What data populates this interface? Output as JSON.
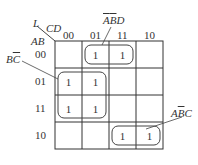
{
  "corner": {
    "l": "L",
    "cd": "CD",
    "ab": "AB"
  },
  "col_headers": [
    "00",
    "01",
    "11",
    "10"
  ],
  "row_headers": [
    "00",
    "01",
    "11",
    "10"
  ],
  "cells": [
    [
      "",
      "1",
      "1",
      ""
    ],
    [
      "1",
      "1",
      "",
      ""
    ],
    [
      "1",
      "1",
      "",
      ""
    ],
    [
      "",
      "",
      "1",
      "1"
    ]
  ],
  "groups": [
    {
      "label_plain": "A",
      "label_bar": "B",
      "label_tail": "D",
      "label_bar2": "A",
      "name": "ĀB̄D"
    },
    {
      "name": "BC̄"
    },
    {
      "name": "AB̄C"
    }
  ],
  "labels": {
    "g1_a": "A",
    "g1_b": "B",
    "g1_d": "D",
    "g2_b": "B",
    "g2_c": "C",
    "g3_a": "A",
    "g3_b": "B",
    "g3_c": "C"
  }
}
